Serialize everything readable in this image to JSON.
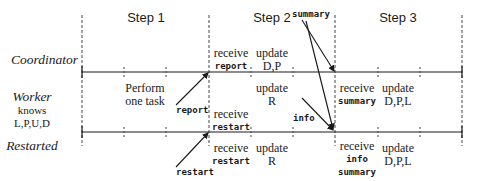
{
  "steps": [
    "Step 1",
    "Step 2",
    "Step 3"
  ],
  "roles": {
    "coordinator": "Coordinator",
    "worker": "Worker",
    "worker_knows": "knows",
    "worker_vars": "L,P,U,D",
    "restarted": "Restarted"
  },
  "step1": {
    "worker_action": [
      "Perform",
      "one task"
    ]
  },
  "step2": {
    "coordinator": [
      {
        "line1": "receive",
        "line2": "report"
      },
      {
        "line1": "update",
        "line2": "D,P"
      }
    ],
    "worker": [
      {
        "line1": "update",
        "line2": "R"
      }
    ],
    "worker_lower": {
      "line1": "receive",
      "line2": "restart"
    },
    "restarted": [
      {
        "line1": "receive",
        "line2": "restart"
      },
      {
        "line1": "update",
        "line2": "R"
      }
    ]
  },
  "step3": {
    "worker": [
      {
        "line1": "receive",
        "line2": "summary"
      },
      {
        "line1": "update",
        "line2": "D,P,L"
      }
    ],
    "restarted": [
      {
        "line1": "receive",
        "line2": "info",
        "line3": "summary"
      },
      {
        "line1": "update",
        "line2": "D,P,L"
      }
    ]
  },
  "messages": {
    "report": "report",
    "restart": "restart",
    "summary": "summary",
    "info": "info"
  },
  "colors": {
    "line": "#1a1a1a",
    "dashed": "#444444",
    "background": "#ffffff"
  }
}
